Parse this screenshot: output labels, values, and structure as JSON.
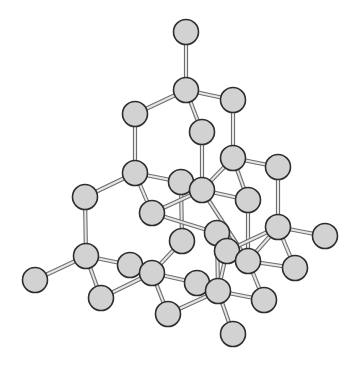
{
  "diagram": {
    "atom_radius": 12.5,
    "colors": {
      "atom_fill": "#d2d2d2",
      "atom_stroke": "#2e2e2e",
      "bond_light": "#e6e6e6",
      "bond_dark": "#6e6e6e",
      "background": "#ffffff"
    },
    "atoms": [
      {
        "id": 0,
        "x": 186,
        "y": 32
      },
      {
        "id": 1,
        "x": 186,
        "y": 90
      },
      {
        "id": 2,
        "x": 233,
        "y": 100
      },
      {
        "id": 3,
        "x": 135,
        "y": 114
      },
      {
        "id": 4,
        "x": 202,
        "y": 132
      },
      {
        "id": 5,
        "x": 135,
        "y": 173
      },
      {
        "id": 6,
        "x": 181,
        "y": 182
      },
      {
        "id": 7,
        "x": 202,
        "y": 190
      },
      {
        "id": 8,
        "x": 233,
        "y": 158
      },
      {
        "id": 9,
        "x": 278,
        "y": 167
      },
      {
        "id": 10,
        "x": 248,
        "y": 200
      },
      {
        "id": 11,
        "x": 85,
        "y": 197
      },
      {
        "id": 12,
        "x": 152,
        "y": 213
      },
      {
        "id": 13,
        "x": 278,
        "y": 227
      },
      {
        "id": 14,
        "x": 325,
        "y": 236
      },
      {
        "id": 15,
        "x": 182,
        "y": 241
      },
      {
        "id": 16,
        "x": 217,
        "y": 233
      },
      {
        "id": 17,
        "x": 227,
        "y": 251
      },
      {
        "id": 18,
        "x": 248,
        "y": 261
      },
      {
        "id": 19,
        "x": 86,
        "y": 256
      },
      {
        "id": 20,
        "x": 35,
        "y": 280
      },
      {
        "id": 21,
        "x": 130,
        "y": 265
      },
      {
        "id": 22,
        "x": 152,
        "y": 273
      },
      {
        "id": 23,
        "x": 101,
        "y": 298
      },
      {
        "id": 24,
        "x": 197,
        "y": 283
      },
      {
        "id": 25,
        "x": 218,
        "y": 291
      },
      {
        "id": 26,
        "x": 295,
        "y": 268
      },
      {
        "id": 27,
        "x": 264,
        "y": 300
      },
      {
        "id": 28,
        "x": 168,
        "y": 314
      },
      {
        "id": 29,
        "x": 233,
        "y": 334
      }
    ],
    "bonds": [
      [
        0,
        1
      ],
      [
        1,
        2
      ],
      [
        1,
        3
      ],
      [
        1,
        4
      ],
      [
        2,
        8
      ],
      [
        3,
        5
      ],
      [
        4,
        7
      ],
      [
        5,
        6
      ],
      [
        5,
        11
      ],
      [
        5,
        12
      ],
      [
        6,
        7
      ],
      [
        6,
        15
      ],
      [
        7,
        8
      ],
      [
        7,
        10
      ],
      [
        7,
        12
      ],
      [
        7,
        18
      ],
      [
        8,
        9
      ],
      [
        8,
        10
      ],
      [
        9,
        13
      ],
      [
        10,
        18
      ],
      [
        11,
        19
      ],
      [
        12,
        16
      ],
      [
        13,
        14
      ],
      [
        13,
        17
      ],
      [
        13,
        18
      ],
      [
        13,
        26
      ],
      [
        15,
        22
      ],
      [
        16,
        25
      ],
      [
        17,
        25
      ],
      [
        18,
        26
      ],
      [
        19,
        20
      ],
      [
        19,
        21
      ],
      [
        19,
        23
      ],
      [
        21,
        22
      ],
      [
        22,
        24
      ],
      [
        22,
        28
      ],
      [
        23,
        22
      ],
      [
        24,
        25
      ],
      [
        25,
        27
      ],
      [
        25,
        29
      ],
      [
        25,
        28
      ],
      [
        18,
        27
      ]
    ]
  }
}
